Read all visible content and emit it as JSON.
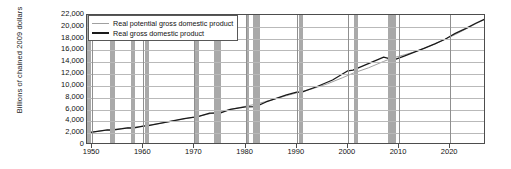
{
  "chart_data": {
    "type": "line",
    "title": "",
    "subtitle": "",
    "xlabel": "",
    "ylabel": "Billions of chained 2009 dollars",
    "xlim": [
      1949,
      2027
    ],
    "ylim": [
      0,
      22000
    ],
    "ytick_labels": [
      "22,000",
      "20,000",
      "18,000",
      "16,000",
      "14,000",
      "12,000",
      "10,000",
      "8,000",
      "6,000",
      "4,000",
      "2,000",
      "0"
    ],
    "ytick_values": [
      22000,
      20000,
      18000,
      16000,
      14000,
      12000,
      10000,
      8000,
      6000,
      4000,
      2000,
      0
    ],
    "xtick_labels": [
      "1950",
      "1960",
      "1970",
      "1980",
      "1990",
      "2000",
      "2010",
      "2020"
    ],
    "xtick_values": [
      1950,
      1960,
      1970,
      1980,
      1990,
      2000,
      2010,
      2020
    ],
    "grid": "horizontal-and-decade-verticals",
    "legend_position": "top-left-inside",
    "legend": [
      {
        "label": "Real potential gross domestic product",
        "color": "#a0a0a0",
        "swatch": "line"
      },
      {
        "label": "Real gross domestic product",
        "color": "#1a1a1a",
        "swatch": "line"
      }
    ],
    "series": [
      {
        "name": "Real potential gross domestic product",
        "color": "#a0a0a0",
        "x": [
          1949,
          1953,
          1957,
          1960,
          1964,
          1968,
          1971,
          1974,
          1977,
          1980,
          1982,
          1985,
          1988,
          1990,
          1993,
          1996,
          1999,
          2001,
          2004,
          2007,
          2009,
          2011,
          2013,
          2015,
          2017,
          2019,
          2021,
          2023,
          2025,
          2027
        ],
        "values": [
          2050,
          2530,
          2920,
          3200,
          3760,
          4420,
          4900,
          5480,
          6010,
          6560,
          6900,
          7600,
          8350,
          8820,
          9500,
          10350,
          11400,
          12150,
          13050,
          14150,
          14800,
          15250,
          15750,
          16400,
          17100,
          17900,
          18700,
          19600,
          20500,
          21400
        ]
      },
      {
        "name": "Real gross domestic product",
        "color": "#1a1a1a",
        "x": [
          1949,
          1950,
          1953,
          1954,
          1957,
          1958,
          1960,
          1961,
          1964,
          1968,
          1970,
          1971,
          1973,
          1975,
          1977,
          1980,
          1982,
          1984,
          1988,
          1990,
          1991,
          1994,
          1997,
          2000,
          2001,
          2004,
          2007,
          2009,
          2011,
          2013,
          2015,
          2017,
          2019,
          2020,
          2021,
          2023,
          2025,
          2027
        ],
        "values": [
          2010,
          2180,
          2550,
          2500,
          2900,
          2850,
          3200,
          3280,
          3800,
          4460,
          4720,
          4880,
          5390,
          5380,
          6020,
          6450,
          6490,
          7280,
          8470,
          8950,
          8940,
          9900,
          11000,
          12560,
          12680,
          13770,
          14870,
          14420,
          15050,
          15710,
          16400,
          17100,
          17900,
          18400,
          18900,
          19700,
          20600,
          21400
        ]
      }
    ],
    "recession_bands": [
      {
        "start": 1949.0,
        "end": 1949.8
      },
      {
        "start": 1953.5,
        "end": 1954.4
      },
      {
        "start": 1957.6,
        "end": 1958.4
      },
      {
        "start": 1960.3,
        "end": 1961.1
      },
      {
        "start": 1969.9,
        "end": 1970.8
      },
      {
        "start": 1973.9,
        "end": 1975.2
      },
      {
        "start": 1980.1,
        "end": 1980.6
      },
      {
        "start": 1981.5,
        "end": 1982.9
      },
      {
        "start": 1990.5,
        "end": 1991.2
      },
      {
        "start": 2001.2,
        "end": 2001.9
      },
      {
        "start": 2007.9,
        "end": 2009.5
      }
    ],
    "colors": {
      "recession_band": "#a9a9a9",
      "gridline": "#b9b9b9",
      "vertical_gridline": "#8f8f8f",
      "axis": "#4d4d4d",
      "background": "#ffffff"
    }
  }
}
